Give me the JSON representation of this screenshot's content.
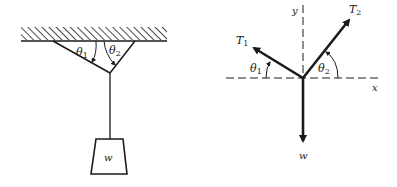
{
  "figure": {
    "left_panel": {
      "description": "Weight hanging from two cables attached to ceiling",
      "angle_labels": [
        {
          "symbol": "θ",
          "subscript": "1"
        },
        {
          "symbol": "θ",
          "subscript": "2"
        }
      ],
      "weight_label": "w"
    },
    "right_panel": {
      "description": "Free-body diagram at knot",
      "axis_labels": {
        "x": "x",
        "y": "y"
      },
      "forces": [
        {
          "symbol": "T",
          "subscript": "1"
        },
        {
          "symbol": "T",
          "subscript": "2"
        },
        {
          "symbol": "w",
          "subscript": ""
        }
      ],
      "angle_labels": [
        {
          "symbol": "θ",
          "subscript": "1"
        },
        {
          "symbol": "θ",
          "subscript": "2"
        }
      ]
    },
    "colors": {
      "ink": "#1a1a1a",
      "background": "#ffffff"
    }
  }
}
